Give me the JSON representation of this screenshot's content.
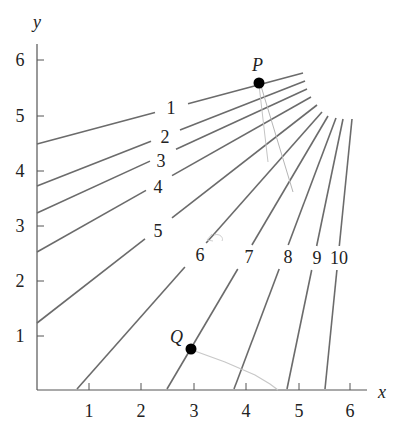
{
  "chart_data": {
    "type": "line",
    "title": "",
    "xlabel": "x",
    "ylabel": "y",
    "xlim": [
      0,
      6.3
    ],
    "ylim": [
      0,
      6.3
    ],
    "x_ticks": [
      "1",
      "2",
      "3",
      "4",
      "5",
      "6"
    ],
    "y_ticks": [
      "1",
      "2",
      "3",
      "4",
      "5",
      "6"
    ],
    "grid": false,
    "series": [
      {
        "name": "1",
        "x": [
          0,
          5.08
        ],
        "y": [
          4.5,
          5.8
        ]
      },
      {
        "name": "2",
        "x": [
          0,
          5.11
        ],
        "y": [
          3.75,
          5.62
        ]
      },
      {
        "name": "3",
        "x": [
          0,
          5.15
        ],
        "y": [
          3.25,
          5.47
        ]
      },
      {
        "name": "4",
        "x": [
          0,
          5.23
        ],
        "y": [
          2.5,
          5.33
        ]
      },
      {
        "name": "5",
        "x": [
          0,
          5.34
        ],
        "y": [
          1.2,
          5.18
        ]
      },
      {
        "name": "6",
        "x": [
          0.76,
          5.44
        ],
        "y": [
          0,
          5.06
        ]
      },
      {
        "name": "7",
        "x": [
          2.48,
          5.55
        ],
        "y": [
          0,
          4.98
        ]
      },
      {
        "name": "8",
        "x": [
          3.76,
          5.71
        ],
        "y": [
          0,
          4.95
        ]
      },
      {
        "name": "9",
        "x": [
          4.77,
          5.84
        ],
        "y": [
          0,
          4.93
        ]
      },
      {
        "name": "10",
        "x": [
          5.5,
          6.01
        ],
        "y": [
          0,
          4.93
        ]
      }
    ],
    "points": [
      {
        "name": "P",
        "x": 4.24,
        "y": 5.58
      },
      {
        "name": "Q",
        "x": 2.94,
        "y": 0.73
      }
    ],
    "annotations": [
      "1",
      "2",
      "3",
      "4",
      "5",
      "6",
      "7",
      "8",
      "9",
      "10",
      "P",
      "Q"
    ]
  },
  "axes": {
    "x_label": "x",
    "y_label": "y",
    "x_ticks": [
      {
        "label": "1",
        "px": 89
      },
      {
        "label": "2",
        "px": 141
      },
      {
        "label": "3",
        "px": 194
      },
      {
        "label": "4",
        "px": 246
      },
      {
        "label": "5",
        "px": 299
      },
      {
        "label": "6",
        "px": 350
      }
    ],
    "y_ticks": [
      {
        "label": "1",
        "py": 336
      },
      {
        "label": "2",
        "py": 281
      },
      {
        "label": "3",
        "py": 226
      },
      {
        "label": "4",
        "py": 171
      },
      {
        "label": "5",
        "py": 116
      },
      {
        "label": "6",
        "py": 60
      }
    ]
  },
  "curves": [
    {
      "label": "1",
      "x1": 37,
      "y1": 144,
      "x2": 303,
      "y2": 73,
      "gap": [
        155,
        188
      ],
      "lx": 171,
      "ly": 114
    },
    {
      "label": "2",
      "x1": 37,
      "y1": 186,
      "x2": 305,
      "y2": 81,
      "gap": [
        151,
        180
      ],
      "lx": 165,
      "ly": 143
    },
    {
      "label": "3",
      "x1": 37,
      "y1": 213,
      "x2": 307,
      "y2": 89,
      "gap": [
        150,
        176
      ],
      "lx": 161,
      "ly": 167
    },
    {
      "label": "4",
      "x1": 37,
      "y1": 252,
      "x2": 311,
      "y2": 97,
      "gap": [
        146,
        172
      ],
      "lx": 158,
      "ly": 193
    },
    {
      "label": "5",
      "x1": 37,
      "y1": 323,
      "x2": 317,
      "y2": 105,
      "gap": [
        145,
        172
      ],
      "lx": 158,
      "ly": 237
    },
    {
      "label": "6",
      "x1": 77,
      "y1": 389,
      "x2": 322,
      "y2": 112,
      "gap": [
        188,
        213
      ],
      "lx": 200,
      "ly": 261
    },
    {
      "label": "7",
      "x1": 167,
      "y1": 389,
      "x2": 328,
      "y2": 116,
      "gap": [
        241,
        259
      ],
      "lx": 249,
      "ly": 263
    },
    {
      "label": "8",
      "x1": 234,
      "y1": 389,
      "x2": 336,
      "y2": 118,
      "gap": [
        280,
        297
      ],
      "lx": 288,
      "ly": 263
    },
    {
      "label": "9",
      "x1": 287,
      "y1": 389,
      "x2": 343,
      "y2": 119,
      "gap": [
        309,
        326
      ],
      "lx": 317,
      "ly": 264
    },
    {
      "label": "10",
      "x1": 325,
      "y1": 389,
      "x2": 352,
      "y2": 119,
      "gap": [
        330,
        348
      ],
      "lx": 339,
      "ly": 264
    }
  ],
  "points": {
    "P": {
      "label": "P",
      "px": 259,
      "py": 83
    },
    "Q": {
      "label": "Q",
      "px": 191,
      "py": 349
    }
  },
  "colors": {
    "axis": "#555555",
    "curve": "#6b6b6b",
    "point": "#000000",
    "annotation_stroke": "#bdbdbd",
    "text": "#222222"
  }
}
